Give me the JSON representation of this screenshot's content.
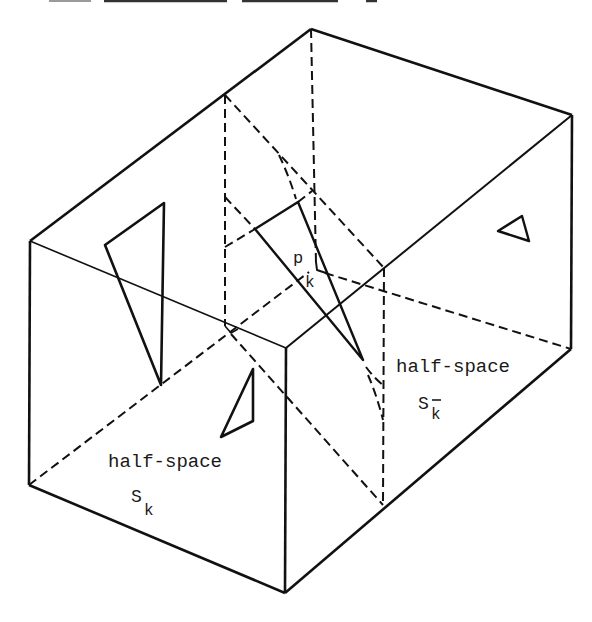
{
  "figure": {
    "background": "#ffffff",
    "ink": "#111111",
    "dash_pattern": "9 5",
    "caption_fragment_color": "#333333",
    "shapes": [
      {
        "name": "cropped-heading-fragment-1",
        "type": "polyline",
        "points": [
          [
            49,
            1
          ],
          [
            91,
            1
          ]
        ],
        "width": 2,
        "color": "#9a9a9a"
      },
      {
        "name": "cropped-heading-fragment-2",
        "type": "polyline",
        "points": [
          [
            104,
            1
          ],
          [
            227,
            1
          ]
        ],
        "width": 2.5,
        "color": "#333333"
      },
      {
        "name": "cropped-heading-fragment-3",
        "type": "polyline",
        "points": [
          [
            242,
            1
          ],
          [
            338,
            1
          ]
        ],
        "width": 2.5,
        "color": "#333333"
      },
      {
        "name": "cropped-heading-fragment-4",
        "type": "polyline",
        "points": [
          [
            366,
            1
          ],
          [
            377,
            1
          ]
        ],
        "width": 2.5,
        "color": "#333333"
      },
      {
        "name": "box-edge-top-back-left",
        "type": "polyline",
        "points": [
          [
            311,
            29
          ],
          [
            30,
            241
          ]
        ],
        "width": 2.6
      },
      {
        "name": "box-edge-top-back-right",
        "type": "polyline",
        "points": [
          [
            311,
            29
          ],
          [
            572,
            115
          ]
        ],
        "width": 2.6
      },
      {
        "name": "box-edge-left-vertical",
        "type": "polyline",
        "points": [
          [
            30,
            241
          ],
          [
            29,
            485
          ]
        ],
        "width": 2.6
      },
      {
        "name": "box-edge-bottom-left",
        "type": "polyline",
        "points": [
          [
            29,
            485
          ],
          [
            285,
            593
          ]
        ],
        "width": 2.6
      },
      {
        "name": "box-edge-front-vertical",
        "type": "polyline",
        "points": [
          [
            286,
            348
          ],
          [
            285,
            593
          ]
        ],
        "width": 2.6
      },
      {
        "name": "box-edge-bottom-right",
        "type": "polyline",
        "points": [
          [
            285,
            593
          ],
          [
            571,
            349
          ]
        ],
        "width": 2.6
      },
      {
        "name": "box-edge-right-vertical",
        "type": "polyline",
        "points": [
          [
            572,
            115
          ],
          [
            571,
            349
          ]
        ],
        "width": 2.6
      },
      {
        "name": "box-edge-top-front-left",
        "type": "polyline",
        "points": [
          [
            30,
            241
          ],
          [
            286,
            348
          ]
        ],
        "width": 1.6
      },
      {
        "name": "box-edge-top-front-right",
        "type": "polyline",
        "points": [
          [
            286,
            348
          ],
          [
            572,
            115
          ]
        ],
        "width": 2
      },
      {
        "name": "hidden-edge-back-vertical",
        "type": "polyline",
        "points": [
          [
            311,
            29
          ],
          [
            316,
            263
          ]
        ],
        "width": 2,
        "dashed": true
      },
      {
        "name": "hidden-edge-bottom-back-left",
        "type": "polyline",
        "points": [
          [
            29,
            485
          ],
          [
            309,
            272
          ]
        ],
        "width": 2,
        "dashed": true
      },
      {
        "name": "hidden-edge-bottom-back-right",
        "type": "polyline",
        "points": [
          [
            325,
            273
          ],
          [
            571,
            349
          ]
        ],
        "width": 2,
        "dashed": true
      },
      {
        "name": "hidden-corner-mark",
        "type": "polyline",
        "points": [
          [
            316,
            262
          ],
          [
            317,
            270
          ],
          [
            326,
            273
          ]
        ],
        "width": 2
      },
      {
        "name": "cutting-plane-left-vertical",
        "type": "polyline",
        "points": [
          [
            225,
            95
          ],
          [
            225,
            326
          ]
        ],
        "width": 2,
        "dashed": true
      },
      {
        "name": "cutting-plane-top-diagonal",
        "type": "polyline",
        "points": [
          [
            225,
            95
          ],
          [
            384,
            268
          ]
        ],
        "width": 2,
        "dashed": true
      },
      {
        "name": "cutting-plane-right-vertical",
        "type": "polyline",
        "points": [
          [
            384,
            268
          ],
          [
            383,
            505
          ]
        ],
        "width": 2,
        "dashed": true
      },
      {
        "name": "cutting-plane-bottom-diagonal",
        "type": "polyline",
        "points": [
          [
            231,
            334
          ],
          [
            383,
            505
          ]
        ],
        "width": 2,
        "dashed": true
      },
      {
        "name": "cutting-plane-corner-hook",
        "type": "polyline",
        "points": [
          [
            225,
            326
          ],
          [
            231,
            333
          ],
          [
            238,
            329
          ]
        ],
        "width": 1.6
      },
      {
        "name": "plane-trace-upper",
        "type": "polyline",
        "points": [
          [
            225,
            197
          ],
          [
            255,
            229
          ]
        ],
        "width": 2,
        "dashed": true
      },
      {
        "name": "plane-trace-lower",
        "type": "polyline",
        "points": [
          [
            225,
            247
          ],
          [
            255,
            229
          ]
        ],
        "width": 2,
        "dashed": true
      },
      {
        "name": "plane-trace-top-extension",
        "type": "polyline",
        "points": [
          [
            298,
            202
          ],
          [
            312,
            191
          ]
        ],
        "width": 2,
        "dashed": true
      },
      {
        "name": "curved-surface-trace-upper",
        "type": "path",
        "d": "M279,155 Q289,176 296,199",
        "width": 2,
        "dashed": true
      },
      {
        "name": "curved-surface-trace-lower-a",
        "type": "path",
        "d": "M366,367 Q374,378 383,385",
        "width": 2,
        "dashed": true
      },
      {
        "name": "curved-surface-trace-lower-b",
        "type": "path",
        "d": "M368,375 Q377,396 383,420",
        "width": 2,
        "dashed": true
      },
      {
        "name": "polygon-p-k",
        "type": "polygon",
        "points": [
          [
            255,
            229
          ],
          [
            298,
            202
          ],
          [
            363,
            360
          ]
        ],
        "width": 2.4
      },
      {
        "name": "polygon-left-triangle",
        "type": "polygon",
        "points": [
          [
            105,
            245
          ],
          [
            164,
            203
          ],
          [
            161,
            385
          ]
        ],
        "width": 2.6
      },
      {
        "name": "polygon-lower-center-triangle",
        "type": "polygon",
        "points": [
          [
            253,
            369
          ],
          [
            253,
            421
          ],
          [
            221,
            437
          ]
        ],
        "width": 2.6
      },
      {
        "name": "polygon-right-triangle",
        "type": "polygon",
        "points": [
          [
            498,
            231
          ],
          [
            522,
            216
          ],
          [
            529,
            241
          ]
        ],
        "width": 2.4
      }
    ],
    "labels": {
      "polygon": {
        "symbol": "p",
        "subscript": "k"
      },
      "left_half_space": {
        "text": "half-space",
        "symbol": "S",
        "subscript": "k"
      },
      "right_half_space": {
        "text": "half-space",
        "symbol": "S",
        "subscript": "k",
        "subscript_overbar": true
      }
    }
  }
}
